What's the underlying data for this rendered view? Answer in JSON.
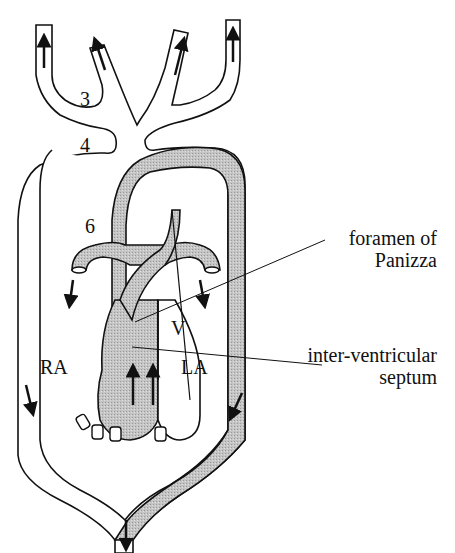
{
  "diagram": {
    "type": "anatomical circulation diagram",
    "colors": {
      "outline": "#111111",
      "oxygen_poor_fill": "#bdbdbd",
      "oxygen_rich_fill": "#ffffff",
      "arrow": "#111111"
    },
    "labels": {
      "arch_3": "3",
      "arch_4": "4",
      "arch_6": "6",
      "ventricle": "V",
      "right_atrium": "RA",
      "left_atrium": "LA"
    },
    "callouts": {
      "foramen_line1": "foramen of",
      "foramen_line2": "Panizza",
      "septum_line1": "inter-ventricular",
      "septum_line2": "septum"
    },
    "arrows": [
      {
        "where": "left outer carotid",
        "direction": "up"
      },
      {
        "where": "left inner carotid",
        "direction": "up"
      },
      {
        "where": "right inner carotid",
        "direction": "up"
      },
      {
        "where": "right outer carotid",
        "direction": "up"
      },
      {
        "where": "left pulmonary",
        "direction": "down"
      },
      {
        "where": "right pulmonary",
        "direction": "down"
      },
      {
        "where": "right atrium",
        "direction": "up"
      },
      {
        "where": "left atrium",
        "direction": "up"
      },
      {
        "where": "left systemic arch",
        "direction": "down"
      },
      {
        "where": "right systemic arch",
        "direction": "down"
      },
      {
        "where": "dorsal aorta",
        "direction": "down"
      }
    ]
  }
}
